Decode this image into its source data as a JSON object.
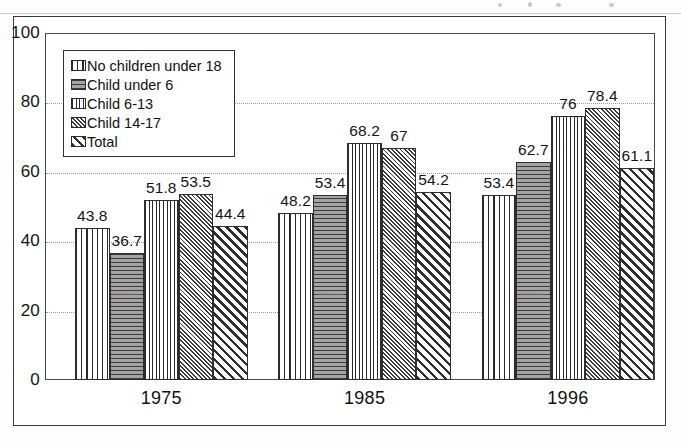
{
  "chart_data": {
    "type": "bar",
    "title": "",
    "xlabel": "",
    "ylabel": "",
    "categories": [
      "1975",
      "1985",
      "1996"
    ],
    "ylim": [
      0,
      100
    ],
    "yticks": [
      "0",
      "20",
      "40",
      "60",
      "80",
      "100"
    ],
    "grid": true,
    "legend_position": "upper-left-inside",
    "series": [
      {
        "name": "No children under 18",
        "pattern": "vertical-stripe",
        "values": [
          43.8,
          48.2,
          53.4
        ],
        "labels": [
          "43.8",
          "48.2",
          "53.4"
        ]
      },
      {
        "name": "Child under 6",
        "pattern": "horizontal-solid-gray",
        "values": [
          36.7,
          53.4,
          62.7
        ],
        "labels": [
          "36.7",
          "53.4",
          "62.7"
        ]
      },
      {
        "name": "Child 6-13",
        "pattern": "fine-grid",
        "values": [
          51.8,
          68.2,
          76
        ],
        "labels": [
          "51.8",
          "68.2",
          "76"
        ]
      },
      {
        "name": "Child 14-17",
        "pattern": "dense-crosshatch",
        "values": [
          53.5,
          67,
          78.4
        ],
        "labels": [
          "53.5",
          "67",
          "78.4"
        ]
      },
      {
        "name": "Total",
        "pattern": "checkerboard",
        "values": [
          44.4,
          54.2,
          61.1
        ],
        "labels": [
          "44.4",
          "54.2",
          "61.1"
        ]
      }
    ]
  },
  "legend": {
    "items": [
      {
        "label": "No children under 18",
        "swatch": "vertical-stripe-swatch"
      },
      {
        "label": "Child under 6",
        "swatch": "horizontal-solid-gray-swatch"
      },
      {
        "label": "Child 6-13",
        "swatch": "fine-grid-swatch"
      },
      {
        "label": "Child 14-17",
        "swatch": "dense-crosshatch-swatch"
      },
      {
        "label": "Total",
        "swatch": "checkerboard-swatch"
      }
    ]
  },
  "colors": {
    "ink": "#141414",
    "frame": "#3a3a3a",
    "gridline": "#9a9a9a",
    "paper": "#ffffff"
  }
}
